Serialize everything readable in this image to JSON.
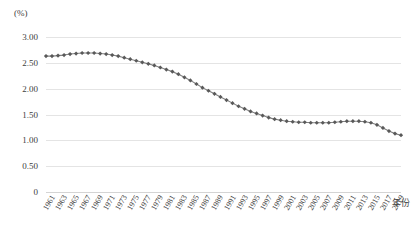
{
  "chart_data": {
    "type": "line",
    "title": "",
    "subtitle": "",
    "xlabel": "年份",
    "ylabel": "(%)",
    "ylim": [
      0,
      3.0
    ],
    "ytick_values": [
      3.0,
      2.5,
      2.0,
      1.5,
      1.0,
      0.5,
      0
    ],
    "ytick_labels": [
      "3.00",
      "2.50",
      "2.00",
      "1.50",
      "1.00",
      "0.50",
      "0"
    ],
    "grid": true,
    "legend": "none",
    "marker": "diamond",
    "marker_color": "#595959",
    "line_color": "#808080",
    "x": [
      1961,
      1962,
      1963,
      1964,
      1965,
      1966,
      1967,
      1968,
      1969,
      1970,
      1971,
      1972,
      1973,
      1974,
      1975,
      1976,
      1977,
      1978,
      1979,
      1980,
      1981,
      1982,
      1983,
      1984,
      1985,
      1986,
      1987,
      1988,
      1989,
      1990,
      1991,
      1992,
      1993,
      1994,
      1995,
      1996,
      1997,
      1998,
      1999,
      2000,
      2001,
      2002,
      2003,
      2004,
      2005,
      2006,
      2007,
      2008,
      2009,
      2010,
      2011,
      2012,
      2013,
      2014,
      2015,
      2016,
      2017,
      2018,
      2019,
      2020
    ],
    "xtick_labels": [
      "1961",
      "1963",
      "1965",
      "1967",
      "1969",
      "1971",
      "1973",
      "1975",
      "1977",
      "1979",
      "1981",
      "1983",
      "1985",
      "1987",
      "1989",
      "1991",
      "1993",
      "1995",
      "1997",
      "1999",
      "2001",
      "2003",
      "2005",
      "2007",
      "2009",
      "2011",
      "2013",
      "2015",
      "2017",
      "2019"
    ],
    "values": [
      2.63,
      2.63,
      2.64,
      2.65,
      2.67,
      2.68,
      2.69,
      2.69,
      2.69,
      2.68,
      2.67,
      2.65,
      2.63,
      2.6,
      2.57,
      2.54,
      2.51,
      2.48,
      2.45,
      2.41,
      2.37,
      2.33,
      2.28,
      2.22,
      2.16,
      2.09,
      2.02,
      1.96,
      1.9,
      1.84,
      1.78,
      1.72,
      1.66,
      1.61,
      1.56,
      1.52,
      1.48,
      1.44,
      1.41,
      1.39,
      1.37,
      1.36,
      1.35,
      1.35,
      1.34,
      1.34,
      1.34,
      1.34,
      1.35,
      1.36,
      1.37,
      1.37,
      1.37,
      1.36,
      1.34,
      1.3,
      1.24,
      1.18,
      1.13,
      1.1
    ]
  }
}
